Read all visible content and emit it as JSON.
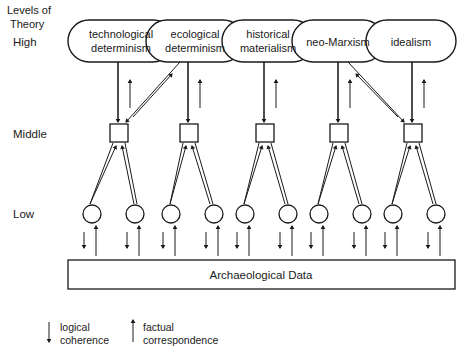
{
  "figure": {
    "corner_label_line1": "Levels of",
    "corner_label_line2": "Theory",
    "levels": [
      {
        "key": "high",
        "label": "High",
        "y": 42
      },
      {
        "key": "middle",
        "label": "Middle",
        "y": 134
      },
      {
        "key": "low",
        "label": "Low",
        "y": 214
      }
    ],
    "high_nodes": [
      {
        "id": "technological-determinism",
        "line1": "technological",
        "line2": "determinism"
      },
      {
        "id": "ecological-determinism",
        "line1": "ecological",
        "line2": "determinism"
      },
      {
        "id": "historical-materialism",
        "line1": "historical",
        "line2": "materialism"
      },
      {
        "id": "neo-marxism",
        "line1": "neo-Marxism",
        "line2": ""
      },
      {
        "id": "idealism",
        "line1": "idealism",
        "line2": ""
      }
    ],
    "middle_nodes": [
      {
        "id": "middle-node-1"
      },
      {
        "id": "middle-node-2"
      },
      {
        "id": "middle-node-3"
      },
      {
        "id": "middle-node-4"
      },
      {
        "id": "middle-node-5"
      }
    ],
    "low_nodes": [
      {
        "id": "low-node-1"
      },
      {
        "id": "low-node-2"
      },
      {
        "id": "low-node-3"
      },
      {
        "id": "low-node-4"
      },
      {
        "id": "low-node-5"
      },
      {
        "id": "low-node-6"
      },
      {
        "id": "low-node-7"
      },
      {
        "id": "low-node-8"
      },
      {
        "id": "low-node-9"
      },
      {
        "id": "low-node-10"
      }
    ],
    "data_box_label": "Archaeological Data",
    "legend": [
      {
        "id": "logical-coherence",
        "direction": "down",
        "line1": "logical",
        "line2": "coherence"
      },
      {
        "id": "factual-correspondence",
        "direction": "up",
        "line1": "factual",
        "line2": "correspondence"
      }
    ],
    "colors": {
      "stroke": "#1a1a1a",
      "fill": "#ffffff",
      "background": "#ffffff"
    }
  }
}
